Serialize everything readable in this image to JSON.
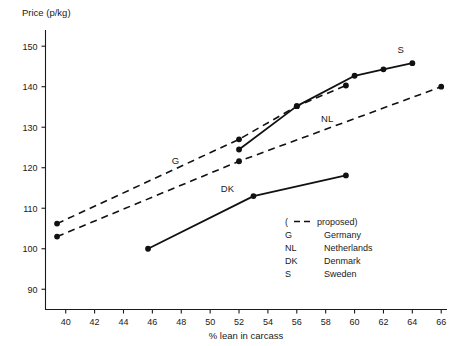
{
  "chart_data": {
    "type": "line",
    "title": "",
    "ylabel": "Price (p/kg)",
    "xlabel": "% lean in carcass",
    "xlim": [
      38.6,
      66.4
    ],
    "ylim": [
      85.0,
      154.0
    ],
    "xticks": [
      40,
      42,
      44,
      46,
      48,
      50,
      52,
      54,
      56,
      58,
      60,
      62,
      64,
      66
    ],
    "yticks": [
      90,
      100,
      110,
      120,
      130,
      140,
      150
    ],
    "grid": false,
    "legend_position": "inside-lower-right",
    "series": [
      {
        "name": "G",
        "full_name": "Germany",
        "style": "dashed",
        "note": "proposed",
        "points": [
          [
            39.4,
            106.2
          ],
          [
            52.0,
            127.0
          ],
          [
            56.0,
            135.2
          ],
          [
            59.4,
            140.3
          ]
        ],
        "label": "G"
      },
      {
        "name": "NL",
        "full_name": "Netherlands",
        "style": "dashed",
        "note": "proposed",
        "points": [
          [
            39.4,
            103.0
          ],
          [
            52.0,
            121.6
          ],
          [
            66.0,
            140.0
          ]
        ],
        "label": "NL"
      },
      {
        "name": "S",
        "full_name": "Sweden",
        "style": "solid",
        "points": [
          [
            52.0,
            124.5
          ],
          [
            56.0,
            135.2
          ],
          [
            60.0,
            142.7
          ],
          [
            62.0,
            144.3
          ],
          [
            64.0,
            145.8
          ]
        ],
        "label": "S"
      },
      {
        "name": "DK",
        "full_name": "Denmark",
        "style": "solid",
        "points": [
          [
            45.7,
            100.0
          ],
          [
            53.0,
            113.0
          ],
          [
            59.4,
            118.1
          ]
        ],
        "label": "DK"
      }
    ],
    "annotations": [
      {
        "text": "G",
        "x": 47.6,
        "y": 120.8
      },
      {
        "text": "NL",
        "x": 58.1,
        "y": 131.3
      },
      {
        "text": "DK",
        "x": 51.2,
        "y": 114.0
      },
      {
        "text": "S",
        "x": 63.2,
        "y": 148.3
      }
    ]
  },
  "legend": {
    "proposed_prefix": "(",
    "proposed_label": "proposed)",
    "rows": [
      {
        "code": "G",
        "country": "Germany"
      },
      {
        "code": "NL",
        "country": "Netherlands"
      },
      {
        "code": "DK",
        "country": "Denmark"
      },
      {
        "code": "S",
        "country": "Sweden"
      }
    ]
  }
}
